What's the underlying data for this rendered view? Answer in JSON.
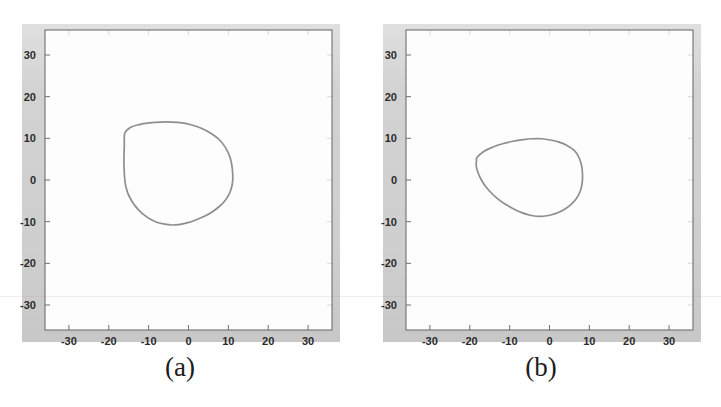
{
  "figure": {
    "caption_a": "(a)",
    "caption_b": "(b)",
    "background_color": "#d2d2d2",
    "axes_color": "#fdfdfd",
    "curve_color": "#8e8e8e",
    "axis_line_color": "#6f6f6f",
    "tick_label_color": "#2b2b2b"
  },
  "chart_data": [
    {
      "type": "line",
      "title": "(a)",
      "xlabel": "",
      "ylabel": "",
      "xlim": [
        -36,
        36
      ],
      "ylim": [
        -36,
        36
      ],
      "xticks": [
        -30,
        -20,
        -10,
        0,
        10,
        20,
        30
      ],
      "yticks": [
        -30,
        -20,
        -10,
        0,
        10,
        20,
        30
      ],
      "xtick_labels": [
        "-30",
        "-20",
        "-10",
        "0",
        "10",
        "20",
        "30"
      ],
      "ytick_labels": [
        "-30",
        "-20",
        "-10",
        "0",
        "10",
        "20",
        "30"
      ],
      "grid": false,
      "legend": null,
      "series": [
        {
          "name": "contour-a",
          "closed": true,
          "x": [
            -16.0,
            -14.6,
            -12.4,
            -9.8,
            -7.0,
            -4.2,
            -1.6,
            0.8,
            3.2,
            5.6,
            7.8,
            9.4,
            10.5,
            11.0,
            11.1,
            10.8,
            10.2,
            9.2,
            7.8,
            6.0,
            4.0,
            1.8,
            -0.4,
            -2.4,
            -4.2,
            -6.0,
            -7.8,
            -9.4,
            -11.0,
            -12.6,
            -14.0,
            -15.2,
            -15.9,
            -16.2,
            -16.1
          ],
          "y": [
            11.2,
            12.6,
            13.3,
            13.7,
            13.9,
            13.9,
            13.7,
            13.2,
            12.4,
            11.2,
            9.6,
            7.6,
            5.2,
            2.6,
            0.0,
            -1.8,
            -3.4,
            -4.9,
            -6.3,
            -7.6,
            -8.7,
            -9.6,
            -10.3,
            -10.7,
            -10.8,
            -10.6,
            -10.2,
            -9.5,
            -8.5,
            -7.1,
            -5.4,
            -3.2,
            -0.6,
            4.0,
            8.4
          ]
        }
      ]
    },
    {
      "type": "line",
      "title": "(b)",
      "xlabel": "",
      "ylabel": "",
      "xlim": [
        -36,
        36
      ],
      "ylim": [
        -36,
        36
      ],
      "xticks": [
        -30,
        -20,
        -10,
        0,
        10,
        20,
        30
      ],
      "yticks": [
        -30,
        -20,
        -10,
        0,
        10,
        20,
        30
      ],
      "xtick_labels": [
        "-30",
        "-20",
        "-10",
        "0",
        "10",
        "20",
        "30"
      ],
      "ytick_labels": [
        "-30",
        "-20",
        "-10",
        "0",
        "10",
        "20",
        "30"
      ],
      "grid": false,
      "legend": null,
      "series": [
        {
          "name": "contour-b",
          "closed": true,
          "x": [
            -18.2,
            -16.4,
            -14.2,
            -11.8,
            -9.2,
            -6.6,
            -4.2,
            -2.0,
            0.2,
            2.4,
            4.4,
            6.2,
            7.4,
            8.1,
            8.3,
            8.1,
            7.6,
            6.7,
            5.5,
            4.0,
            2.2,
            0.3,
            -1.6,
            -3.4,
            -5.1,
            -6.8,
            -8.5,
            -10.2,
            -11.9,
            -13.5,
            -15.0,
            -16.3,
            -17.4,
            -18.1,
            -18.4,
            -18.3
          ],
          "y": [
            5.4,
            6.9,
            7.9,
            8.7,
            9.3,
            9.7,
            9.9,
            9.9,
            9.6,
            9.1,
            8.3,
            7.1,
            5.4,
            3.2,
            0.8,
            -1.3,
            -3.0,
            -4.5,
            -5.8,
            -6.9,
            -7.8,
            -8.4,
            -8.7,
            -8.7,
            -8.4,
            -7.9,
            -7.2,
            -6.3,
            -5.3,
            -4.1,
            -2.7,
            -1.2,
            0.6,
            2.2,
            3.6,
            4.6
          ]
        }
      ]
    }
  ]
}
